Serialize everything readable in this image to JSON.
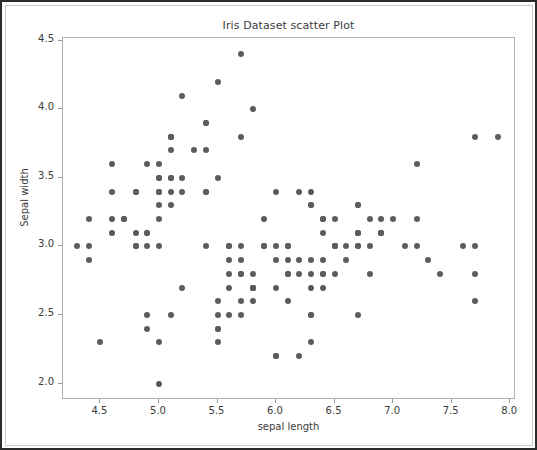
{
  "chart_data": {
    "type": "scatter",
    "title": "Iris Dataset scatter Plot",
    "xlabel": "sepal length",
    "ylabel": "Sepal width",
    "xlim": [
      4.18,
      8.05
    ],
    "ylim": [
      1.88,
      4.52
    ],
    "xticks": [
      4.5,
      5.0,
      5.5,
      6.0,
      6.5,
      7.0,
      7.5,
      8.0
    ],
    "xtick_labels": [
      "4.5",
      "5.0",
      "5.5",
      "6.0",
      "6.5",
      "7.0",
      "7.5",
      "8.0"
    ],
    "yticks": [
      2.0,
      2.5,
      3.0,
      3.5,
      4.0,
      4.5
    ],
    "ytick_labels": [
      "2.0",
      "2.5",
      "3.0",
      "3.5",
      "4.0",
      "4.5"
    ],
    "grid": false,
    "legend": null,
    "marker_color": "#5c5c5c",
    "marker_size": 6,
    "background_color": "#ffffff",
    "n_points": 150,
    "points": [
      [
        5.1,
        3.5
      ],
      [
        4.9,
        3.0
      ],
      [
        4.7,
        3.2
      ],
      [
        4.6,
        3.1
      ],
      [
        5.0,
        3.6
      ],
      [
        5.4,
        3.9
      ],
      [
        4.6,
        3.4
      ],
      [
        5.0,
        3.4
      ],
      [
        4.4,
        2.9
      ],
      [
        4.9,
        3.1
      ],
      [
        5.4,
        3.7
      ],
      [
        4.8,
        3.4
      ],
      [
        4.8,
        3.0
      ],
      [
        4.3,
        3.0
      ],
      [
        5.8,
        4.0
      ],
      [
        5.7,
        4.4
      ],
      [
        5.4,
        3.9
      ],
      [
        5.1,
        3.5
      ],
      [
        5.7,
        3.8
      ],
      [
        5.1,
        3.8
      ],
      [
        5.4,
        3.4
      ],
      [
        5.1,
        3.7
      ],
      [
        4.6,
        3.6
      ],
      [
        5.1,
        3.3
      ],
      [
        4.8,
        3.4
      ],
      [
        5.0,
        3.0
      ],
      [
        5.0,
        3.4
      ],
      [
        5.2,
        3.5
      ],
      [
        5.2,
        3.4
      ],
      [
        4.7,
        3.2
      ],
      [
        4.8,
        3.1
      ],
      [
        5.4,
        3.4
      ],
      [
        5.2,
        4.1
      ],
      [
        5.5,
        4.2
      ],
      [
        4.9,
        3.1
      ],
      [
        5.0,
        3.2
      ],
      [
        5.5,
        3.5
      ],
      [
        4.9,
        3.6
      ],
      [
        4.4,
        3.0
      ],
      [
        5.1,
        3.4
      ],
      [
        5.0,
        3.5
      ],
      [
        4.5,
        2.3
      ],
      [
        4.4,
        3.2
      ],
      [
        5.0,
        3.5
      ],
      [
        5.1,
        3.8
      ],
      [
        4.8,
        3.0
      ],
      [
        5.1,
        3.8
      ],
      [
        4.6,
        3.2
      ],
      [
        5.3,
        3.7
      ],
      [
        5.0,
        3.3
      ],
      [
        7.0,
        3.2
      ],
      [
        6.4,
        3.2
      ],
      [
        6.9,
        3.1
      ],
      [
        5.5,
        2.3
      ],
      [
        6.5,
        2.8
      ],
      [
        5.7,
        2.8
      ],
      [
        6.3,
        3.3
      ],
      [
        4.9,
        2.4
      ],
      [
        6.6,
        2.9
      ],
      [
        5.2,
        2.7
      ],
      [
        5.0,
        2.0
      ],
      [
        5.9,
        3.0
      ],
      [
        6.0,
        2.2
      ],
      [
        6.1,
        2.9
      ],
      [
        5.6,
        2.9
      ],
      [
        6.7,
        3.1
      ],
      [
        5.6,
        3.0
      ],
      [
        5.8,
        2.7
      ],
      [
        6.2,
        2.2
      ],
      [
        5.6,
        2.5
      ],
      [
        5.9,
        3.2
      ],
      [
        6.1,
        2.8
      ],
      [
        6.3,
        2.5
      ],
      [
        6.1,
        2.8
      ],
      [
        6.4,
        2.9
      ],
      [
        6.6,
        3.0
      ],
      [
        6.8,
        2.8
      ],
      [
        6.7,
        3.0
      ],
      [
        6.0,
        2.9
      ],
      [
        5.7,
        2.6
      ],
      [
        5.5,
        2.4
      ],
      [
        5.5,
        2.4
      ],
      [
        5.8,
        2.7
      ],
      [
        6.0,
        2.7
      ],
      [
        5.4,
        3.0
      ],
      [
        6.0,
        3.4
      ],
      [
        6.7,
        3.1
      ],
      [
        6.3,
        2.3
      ],
      [
        5.6,
        3.0
      ],
      [
        5.5,
        2.5
      ],
      [
        5.5,
        2.6
      ],
      [
        6.1,
        3.0
      ],
      [
        5.8,
        2.6
      ],
      [
        5.0,
        2.3
      ],
      [
        5.6,
        2.7
      ],
      [
        5.7,
        3.0
      ],
      [
        5.7,
        2.9
      ],
      [
        6.2,
        2.9
      ],
      [
        5.1,
        2.5
      ],
      [
        5.7,
        2.8
      ],
      [
        6.3,
        3.3
      ],
      [
        5.8,
        2.7
      ],
      [
        7.1,
        3.0
      ],
      [
        6.3,
        2.9
      ],
      [
        6.5,
        3.0
      ],
      [
        7.6,
        3.0
      ],
      [
        4.9,
        2.5
      ],
      [
        7.3,
        2.9
      ],
      [
        6.7,
        2.5
      ],
      [
        7.2,
        3.6
      ],
      [
        6.5,
        3.2
      ],
      [
        6.4,
        2.7
      ],
      [
        6.8,
        3.0
      ],
      [
        5.7,
        2.5
      ],
      [
        5.8,
        2.8
      ],
      [
        6.4,
        3.2
      ],
      [
        6.5,
        3.0
      ],
      [
        7.7,
        3.8
      ],
      [
        7.7,
        2.6
      ],
      [
        6.0,
        2.2
      ],
      [
        6.9,
        3.2
      ],
      [
        5.6,
        2.8
      ],
      [
        7.7,
        2.8
      ],
      [
        6.3,
        2.7
      ],
      [
        6.7,
        3.3
      ],
      [
        7.2,
        3.2
      ],
      [
        6.2,
        2.8
      ],
      [
        6.1,
        3.0
      ],
      [
        6.4,
        2.8
      ],
      [
        7.2,
        3.0
      ],
      [
        7.4,
        2.8
      ],
      [
        7.9,
        3.8
      ],
      [
        6.4,
        2.8
      ],
      [
        6.3,
        2.8
      ],
      [
        6.1,
        2.6
      ],
      [
        7.7,
        3.0
      ],
      [
        6.3,
        3.4
      ],
      [
        6.4,
        3.1
      ],
      [
        6.0,
        3.0
      ],
      [
        6.9,
        3.1
      ],
      [
        6.7,
        3.1
      ],
      [
        6.9,
        3.1
      ],
      [
        5.8,
        2.7
      ],
      [
        6.8,
        3.2
      ],
      [
        6.7,
        3.3
      ],
      [
        6.7,
        3.0
      ],
      [
        6.3,
        2.5
      ],
      [
        6.5,
        3.0
      ],
      [
        6.2,
        3.4
      ],
      [
        5.9,
        3.0
      ]
    ]
  }
}
